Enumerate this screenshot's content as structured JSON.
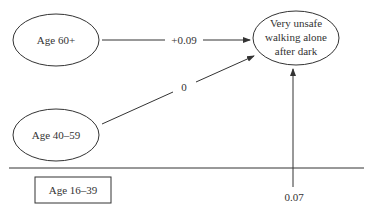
{
  "diagram": {
    "nodes": {
      "age_60_plus": {
        "label": "Age 60+"
      },
      "age_40_59": {
        "label": "Age 40–59"
      },
      "age_16_39": {
        "label": "Age 16–39"
      },
      "outcome": {
        "lines": [
          "Very unsafe",
          "walking alone",
          "after dark"
        ]
      }
    },
    "edges": {
      "age60_to_outcome": {
        "label": "+0.09"
      },
      "age40_to_outcome": {
        "label": "0"
      },
      "baseline_to_outcome": {
        "label": "0.07"
      }
    },
    "colors": {
      "stroke": "#333333",
      "text": "#333333",
      "background": "#ffffff"
    }
  }
}
